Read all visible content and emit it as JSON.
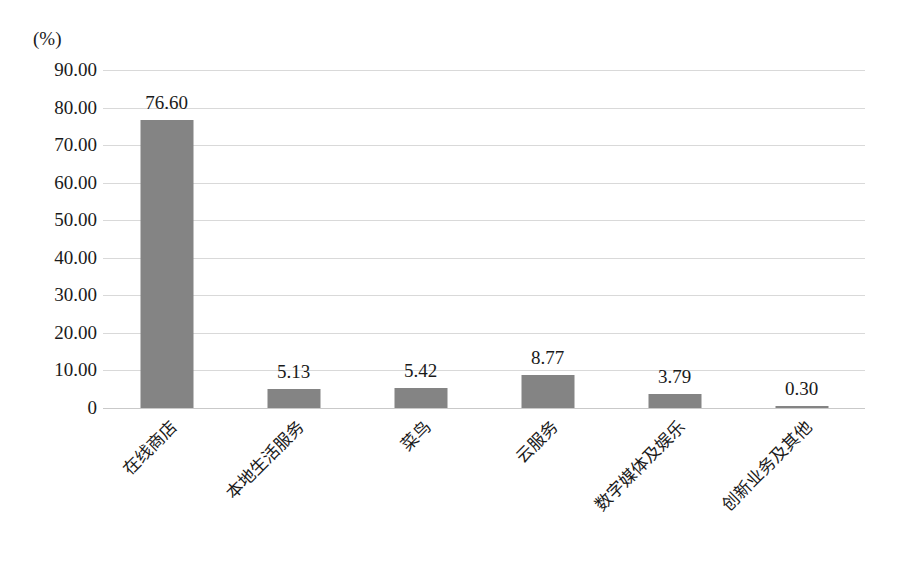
{
  "chart_data": {
    "type": "bar",
    "title": "",
    "subtitle": "",
    "xlabel": "",
    "ylabel": "",
    "unit_label": "(%)",
    "categories": [
      "在线商店",
      "本地生活服务",
      "菜鸟",
      "云服务",
      "数字媒体及娱乐",
      "创新业务及其他"
    ],
    "values": [
      76.6,
      5.13,
      5.42,
      8.77,
      3.79,
      0.3
    ],
    "value_labels": [
      "76.60",
      "5.13",
      "5.42",
      "8.77",
      "3.79",
      "0.30"
    ],
    "ylim": [
      0,
      90
    ],
    "ytick_values": [
      90,
      80,
      70,
      60,
      50,
      40,
      30,
      20,
      10,
      0
    ],
    "ytick_labels": [
      "90.00",
      "80.00",
      "70.00",
      "60.00",
      "50.00",
      "40.00",
      "30.00",
      "20.00",
      "10.00",
      "0"
    ],
    "grid": true,
    "legend": "none",
    "bar_color": "#848484",
    "grid_color": "#d9d9d9",
    "text_color": "#1a1a1a",
    "background_color": "#ffffff"
  }
}
